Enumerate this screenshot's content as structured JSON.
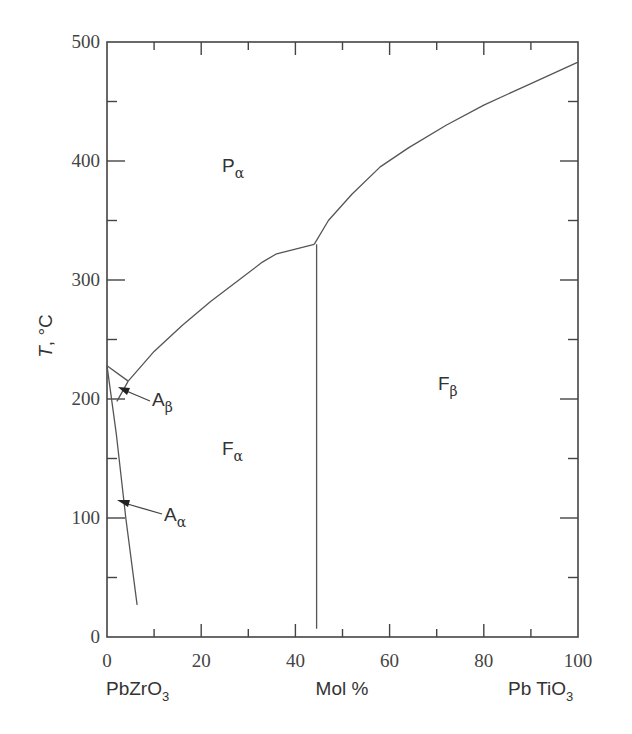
{
  "chart_data": {
    "type": "line",
    "title": "",
    "xlabel": "Mol %",
    "ylabel": "T, °C",
    "x_left_label": "PbZrO3",
    "x_right_label": "Pb TiO3",
    "xlim": [
      0,
      100
    ],
    "ylim": [
      0,
      500
    ],
    "x_ticks": [
      0,
      20,
      40,
      60,
      80,
      100
    ],
    "y_ticks": [
      0,
      100,
      200,
      300,
      400,
      500
    ],
    "grid": false,
    "series": [
      {
        "name": "Pα/Fα boundary",
        "x": [
          4.5,
          10,
          16,
          22,
          28,
          33,
          36,
          40,
          44
        ],
        "y": [
          215,
          240,
          262,
          282,
          300,
          315,
          322,
          326,
          330
        ]
      },
      {
        "name": "Pα/Fβ boundary",
        "x": [
          44,
          47,
          52,
          58,
          64,
          72,
          80,
          90,
          100
        ],
        "y": [
          330,
          350,
          372,
          395,
          411,
          430,
          447,
          465,
          483
        ]
      },
      {
        "name": "Fα/Fβ boundary",
        "x": [
          44.5,
          44.5
        ],
        "y": [
          330,
          7
        ]
      },
      {
        "name": "Pα/Aβ boundary",
        "x": [
          0,
          4.5
        ],
        "y": [
          228,
          215
        ]
      },
      {
        "name": "Aβ/Fα boundary",
        "x": [
          4.5,
          2.1
        ],
        "y": [
          215,
          198
        ]
      },
      {
        "name": "Aα/Fα boundary",
        "x": [
          0,
          2,
          4,
          6.4
        ],
        "y": [
          228,
          170,
          100,
          27
        ]
      }
    ],
    "annotations": [
      {
        "text": "Pα",
        "x": 27,
        "y": 393
      },
      {
        "text": "Fα",
        "x": 27,
        "y": 158
      },
      {
        "text": "Fβ",
        "x": 73,
        "y": 210
      },
      {
        "text": "Aβ",
        "x": 11,
        "y": 195,
        "arrow_to": [
          2.5,
          210
        ]
      },
      {
        "text": "Aα",
        "x": 12,
        "y": 100,
        "arrow_to": [
          2,
          115
        ]
      }
    ]
  },
  "labels": {
    "y_axis": "T, °C",
    "x_axis": "Mol %",
    "left_compound": "PbZrO",
    "left_sub": "3",
    "right_compound": "Pb TiO",
    "right_sub": "3",
    "regions": {
      "P_alpha": {
        "main": "P",
        "sub": "α"
      },
      "F_alpha": {
        "main": "F",
        "sub": "α"
      },
      "F_beta": {
        "main": "F",
        "sub": "β"
      },
      "A_beta": {
        "main": "A",
        "sub": "β"
      },
      "A_alpha": {
        "main": "A",
        "sub": "α"
      }
    },
    "x_tick_labels": [
      "0",
      "20",
      "40",
      "60",
      "80",
      "100"
    ],
    "y_tick_labels": [
      "0",
      "100",
      "200",
      "300",
      "400",
      "500"
    ]
  }
}
